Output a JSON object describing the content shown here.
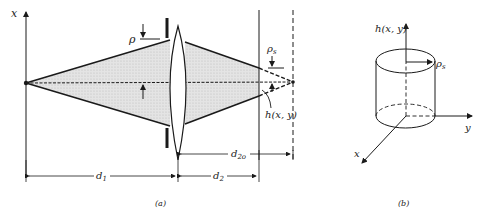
{
  "figure_a": {
    "caption": "(a)",
    "axis_label": "x",
    "rho_label": "ρ",
    "rho_s_label": "ρ",
    "rho_s_sub": "s",
    "h_label": "h(x, y)",
    "d1_label": "d",
    "d1_sub": "1",
    "d2_label": "d",
    "d2_sub": "2",
    "d2o_label": "d",
    "d2o_sub": "2o"
  },
  "figure_b": {
    "caption": "(b)",
    "h_label": "h(x, y)",
    "rho_s_label": "ρ",
    "rho_s_sub": "s",
    "y_label": "y",
    "x_label": "x"
  },
  "colors": {
    "line": "#1a1a1a",
    "shade": "#d9d9d9"
  }
}
